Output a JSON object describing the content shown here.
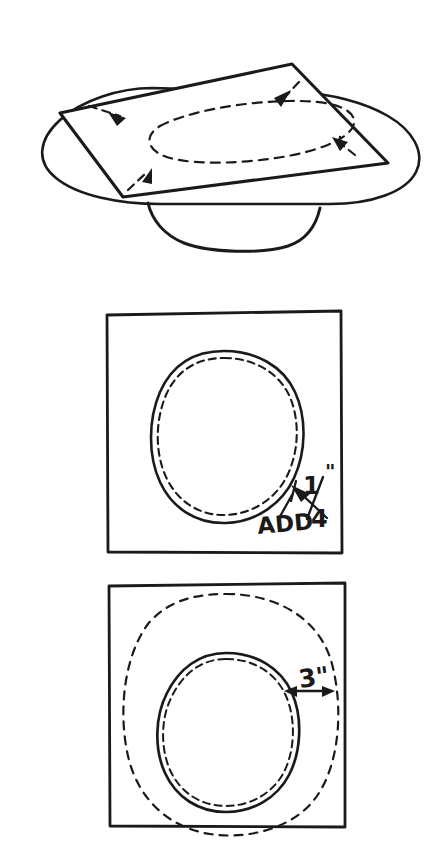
{
  "figure": {
    "background_color": "#ffffff",
    "ink_color": "#1a1a1a",
    "panel_count": 3
  },
  "panels": {
    "top": {
      "name": "perspective-view",
      "description": "Square sheet of foil laid over an oval pan, dashed outline of pan rim showing through, dashed corner fold marks"
    },
    "middle": {
      "name": "traced-outline-panel",
      "annotations": [
        {
          "id": "add-label",
          "text": "ADD",
          "x": 258,
          "y": 531
        },
        {
          "id": "quarter-inch-label",
          "numerator": "1",
          "denominator": "4",
          "unit": "\"",
          "text": "1/4\"",
          "x": 308,
          "y": 494
        }
      ]
    },
    "bottom": {
      "name": "offset-outline-panel",
      "annotations": [
        {
          "id": "three-inch-label",
          "text": "3\"",
          "value": "3",
          "unit": "\"",
          "x": 300,
          "y": 678
        }
      ]
    }
  }
}
